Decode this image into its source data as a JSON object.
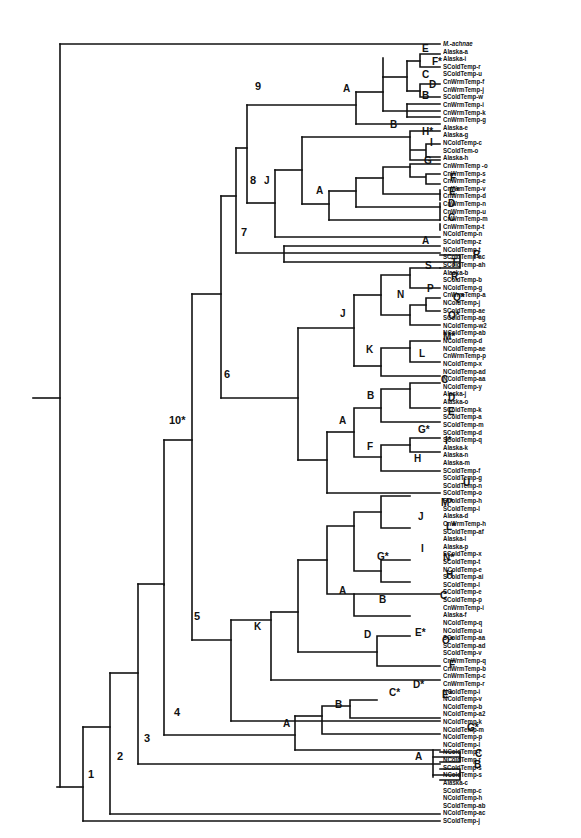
{
  "figure": {
    "type": "phylogenetic-tree",
    "tips": [
      "M.-achnae",
      "Alaska-a",
      "Alaska-i",
      "SColdTemp-r",
      "SColdTemp-u",
      "CnWrmTemp-f",
      "CnWrmTemp-j",
      "SColdTemp-w",
      "CnWrmTemp-i",
      "CnWrmTemp-k",
      "CnWrmTemp-g",
      "Alaska-e",
      "Alaska-g",
      "NColdTemp-c",
      "SColdTem-o",
      "Alaska-h",
      "CnWrmTemp -o",
      "CnWrmTemp-s",
      "CnWrmTemp-e",
      "CnWrmTemp-v",
      "CnWrmTemp-d",
      "CnWrmTemp-n",
      "CnWrmTemp-u",
      "CnWrmTemp-m",
      "CnWrmTemp-t",
      "NColdTemp-n",
      "SColdTemp-z",
      "NColdTemp-t",
      "SColdTemp-ac",
      "SColdTemp-ah",
      "Alaska-b",
      "SColdTemp-b",
      "NColdTemp-g",
      "CnWrmTemp-a",
      "NColdTemp-j",
      "SColdTemp-ae",
      "SColdTemp-ag",
      "NColdTemp-w2",
      "NColdTemp-ab",
      "NColdTemp-d",
      "NColdTemp-ae",
      "CnWrmTemp-p",
      "NColdTemp-x",
      "NColdTemp-ad",
      "NColdTemp-aa",
      "NColdTemp-y",
      "Alaska-j",
      "Alaska-o",
      "SColdTemp-k",
      "SColdTemp-a",
      "SColdTemp-m",
      "SColdTemp-d",
      "SColdTemp-q",
      "Alaska-k",
      "Alaska-n",
      "Alaska-m",
      "SColdTemp-f",
      "SColdTemp-g",
      "SColdTemp-n",
      "SColdTemp-o",
      "SColdTemp-h",
      "SColdTemp-l",
      "Alaska-d",
      "CnWrmTemp-h",
      "SColdTemp-af",
      "Alaska-l",
      "Alaska-p",
      "SColdTemp-x",
      "SColdTemp-t",
      "NColdTemp-e",
      "SColdTemp-ai",
      "SColdTemp-l",
      "SColdTemp-e",
      "SColdTemp-p",
      "CnWrmTemp-i",
      "Alaska-f",
      "NColdTemp-q",
      "NColdTemp-u",
      "SColdTemp-aa",
      "SColdTemp-ad",
      "SColdTemp-v",
      "CnWrmTemp-q",
      "CnWrmTemp-b",
      "CnWrmTemp-c",
      "CnWrmTemp-r",
      "NColdTemp-i",
      "NColdTemp-v",
      "NColdTemp-b",
      "NColdTemp-a2",
      "NColdTemp-k",
      "NColdTemp-m",
      "NColdTemp-p",
      "NColdTemp-l",
      "NColdTemp-f",
      "NColdTemp-r",
      "SColdTemp-s",
      "NColdTemp-s",
      "Alaska-c",
      "SColdTemp-c",
      "NColdTemp-h",
      "SColdTemp-ab",
      "NColdTemp-ac",
      "SColdTemp-j"
    ],
    "outgroup_italic_tip": "M.-achnae",
    "major_nodes": [
      {
        "label": "1",
        "x": 88,
        "y": 780
      },
      {
        "label": "2",
        "x": 117,
        "y": 762
      },
      {
        "label": "3",
        "x": 144,
        "y": 744
      },
      {
        "label": "4",
        "x": 174,
        "y": 718
      },
      {
        "label": "5",
        "x": 194,
        "y": 622
      },
      {
        "label": "6",
        "x": 224,
        "y": 380
      },
      {
        "label": "7",
        "x": 241,
        "y": 238
      },
      {
        "label": "8",
        "x": 250,
        "y": 186
      },
      {
        "label": "9",
        "x": 255,
        "y": 92
      },
      {
        "label": "10*",
        "x": 169,
        "y": 426
      }
    ],
    "clade_labels": [
      {
        "label": "J",
        "x": 264,
        "y": 186
      },
      {
        "label": "A",
        "x": 343,
        "y": 94
      },
      {
        "label": "E",
        "x": 422,
        "y": 54
      },
      {
        "label": "F*",
        "x": 432,
        "y": 67
      },
      {
        "label": "C",
        "x": 422,
        "y": 80
      },
      {
        "label": "D",
        "x": 429,
        "y": 90
      },
      {
        "label": "B",
        "x": 422,
        "y": 101
      },
      {
        "label": "B",
        "x": 390,
        "y": 130
      },
      {
        "label": "H*",
        "x": 422,
        "y": 137
      },
      {
        "label": "I",
        "x": 430,
        "y": 148
      },
      {
        "label": "G",
        "x": 424,
        "y": 166
      },
      {
        "label": "A",
        "x": 316,
        "y": 196
      },
      {
        "label": "F",
        "x": 450,
        "y": 183
      },
      {
        "label": "E*",
        "x": 449,
        "y": 197
      },
      {
        "label": "D",
        "x": 448,
        "y": 209
      },
      {
        "label": "C",
        "x": 448,
        "y": 223
      },
      {
        "label": "A",
        "x": 422,
        "y": 246
      },
      {
        "label": "R",
        "x": 473,
        "y": 260
      },
      {
        "label": "S",
        "x": 425,
        "y": 271
      },
      {
        "label": "T",
        "x": 451,
        "y": 268
      },
      {
        "label": "R",
        "x": 451,
        "y": 282
      },
      {
        "label": "N",
        "x": 397,
        "y": 300
      },
      {
        "label": "P",
        "x": 427,
        "y": 294
      },
      {
        "label": "Q*",
        "x": 453,
        "y": 303
      },
      {
        "label": "O*",
        "x": 448,
        "y": 321
      },
      {
        "label": "J",
        "x": 340,
        "y": 319
      },
      {
        "label": "M*",
        "x": 443,
        "y": 342
      },
      {
        "label": "K",
        "x": 366,
        "y": 355
      },
      {
        "label": "L",
        "x": 419,
        "y": 359
      },
      {
        "label": "C",
        "x": 441,
        "y": 385
      },
      {
        "label": "D",
        "x": 448,
        "y": 403
      },
      {
        "label": "E",
        "x": 448,
        "y": 417
      },
      {
        "label": "B",
        "x": 367,
        "y": 401
      },
      {
        "label": "A",
        "x": 339,
        "y": 426
      },
      {
        "label": "G*",
        "x": 418,
        "y": 435
      },
      {
        "label": "I*",
        "x": 445,
        "y": 446
      },
      {
        "label": "F",
        "x": 367,
        "y": 452
      },
      {
        "label": "H",
        "x": 414,
        "y": 464
      },
      {
        "label": "U",
        "x": 463,
        "y": 488
      },
      {
        "label": "M*",
        "x": 441,
        "y": 508
      },
      {
        "label": "J",
        "x": 418,
        "y": 522
      },
      {
        "label": "L*",
        "x": 446,
        "y": 532
      },
      {
        "label": "I",
        "x": 421,
        "y": 554
      },
      {
        "label": "N*",
        "x": 443,
        "y": 563
      },
      {
        "label": "G*",
        "x": 377,
        "y": 562
      },
      {
        "label": "H",
        "x": 446,
        "y": 580
      },
      {
        "label": "A",
        "x": 339,
        "y": 596
      },
      {
        "label": "B",
        "x": 379,
        "y": 605
      },
      {
        "label": "C",
        "x": 440,
        "y": 601
      },
      {
        "label": "K",
        "x": 254,
        "y": 632
      },
      {
        "label": "D",
        "x": 364,
        "y": 640
      },
      {
        "label": "E*",
        "x": 415,
        "y": 638
      },
      {
        "label": "O*",
        "x": 442,
        "y": 646
      },
      {
        "label": "F",
        "x": 449,
        "y": 670
      },
      {
        "label": "B",
        "x": 335,
        "y": 710
      },
      {
        "label": "C*",
        "x": 389,
        "y": 698
      },
      {
        "label": "D*",
        "x": 413,
        "y": 690
      },
      {
        "label": "E*",
        "x": 442,
        "y": 700
      },
      {
        "label": "A",
        "x": 283,
        "y": 729
      },
      {
        "label": "G*",
        "x": 467,
        "y": 733
      },
      {
        "label": "A",
        "x": 415,
        "y": 762
      },
      {
        "label": "C",
        "x": 475,
        "y": 759
      },
      {
        "label": "B",
        "x": 474,
        "y": 770
      }
    ]
  }
}
